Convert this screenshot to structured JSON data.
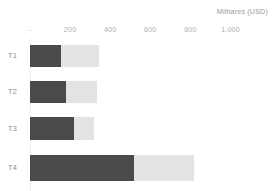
{
  "chart_data": {
    "type": "bar",
    "orientation": "horizontal",
    "stacked": true,
    "title": "",
    "axis_title": "Milhares (USD)",
    "xlabel": "Milhares (USD)",
    "ylabel": "",
    "categories": [
      "T1",
      "T2",
      "T3",
      "T4"
    ],
    "tick_labels": [
      "-",
      "200",
      "400",
      "600",
      "800",
      "1.000"
    ],
    "tick_values": [
      0,
      200,
      400,
      600,
      800,
      1000
    ],
    "xlim": [
      0,
      1000
    ],
    "grid": false,
    "legend": "none",
    "series": [
      {
        "name": "Série 1",
        "color": "#4a4a4a",
        "values": [
          155,
          180,
          220,
          520
        ]
      },
      {
        "name": "Série 2",
        "color": "#e3e3e3",
        "values": [
          190,
          155,
          100,
          300
        ]
      }
    ],
    "totals": [
      345,
      335,
      320,
      820
    ]
  },
  "axis": {
    "title": "Milhares (USD)",
    "ticks": [
      {
        "label": "-",
        "value": 0
      },
      {
        "label": "200",
        "value": 200
      },
      {
        "label": "400",
        "value": 400
      },
      {
        "label": "600",
        "value": 600
      },
      {
        "label": "800",
        "value": 800
      },
      {
        "label": "1.000",
        "value": 1000
      }
    ]
  },
  "rows": [
    {
      "label": "T1",
      "dark": 155,
      "light": 190
    },
    {
      "label": "T2",
      "dark": 180,
      "light": 155
    },
    {
      "label": "T3",
      "dark": 220,
      "light": 100
    },
    {
      "label": "T4",
      "dark": 520,
      "light": 300
    }
  ],
  "colors": {
    "series_dark": "#4a4a4a",
    "series_light": "#e3e3e3",
    "axis_line": "#ededed",
    "tick_text": "#b0b0b0",
    "category_text": "#8c8c8c",
    "title_text": "#9a9a9a",
    "background": "#ffffff"
  }
}
